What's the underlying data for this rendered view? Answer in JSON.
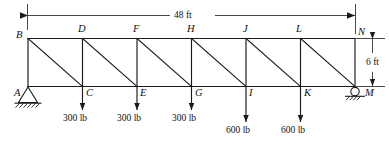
{
  "figure": {
    "type": "truss-diagram",
    "title": "",
    "units": "ft / lb",
    "ink_color": "#1a1a1a",
    "background": "#ffffff"
  },
  "dimensions": {
    "span": {
      "label": "48 ft",
      "value": 48,
      "unit": "ft",
      "orientation": "horizontal",
      "position": "top"
    },
    "depth": {
      "label": "6 ft",
      "value": 6,
      "unit": "ft",
      "orientation": "vertical",
      "position": "right"
    }
  },
  "geometry": {
    "panels": 6,
    "panel_length_ft": 8,
    "height_ft": 6,
    "top_chord_nodes": [
      "B",
      "D",
      "F",
      "H",
      "J",
      "L",
      "N"
    ],
    "bottom_chord_nodes": [
      "A",
      "C",
      "E",
      "G",
      "I",
      "K",
      "M"
    ]
  },
  "nodes": [
    {
      "id": "B",
      "chord": "top",
      "label": "B",
      "x_ft": 0,
      "y_ft": 6
    },
    {
      "id": "D",
      "chord": "top",
      "label": "D",
      "x_ft": 8,
      "y_ft": 6
    },
    {
      "id": "F",
      "chord": "top",
      "label": "F",
      "x_ft": 16,
      "y_ft": 6
    },
    {
      "id": "H",
      "chord": "top",
      "label": "H",
      "x_ft": 24,
      "y_ft": 6
    },
    {
      "id": "J",
      "chord": "top",
      "label": "J",
      "x_ft": 32,
      "y_ft": 6
    },
    {
      "id": "L",
      "chord": "top",
      "label": "L",
      "x_ft": 40,
      "y_ft": 6
    },
    {
      "id": "N",
      "chord": "top",
      "label": "N",
      "x_ft": 48,
      "y_ft": 6
    },
    {
      "id": "A",
      "chord": "bottom",
      "label": "A",
      "x_ft": 0,
      "y_ft": 0
    },
    {
      "id": "C",
      "chord": "bottom",
      "label": "C",
      "x_ft": 8,
      "y_ft": 0
    },
    {
      "id": "E",
      "chord": "bottom",
      "label": "E",
      "x_ft": 16,
      "y_ft": 0
    },
    {
      "id": "G",
      "chord": "bottom",
      "label": "G",
      "x_ft": 24,
      "y_ft": 0
    },
    {
      "id": "I",
      "chord": "bottom",
      "label": "I",
      "x_ft": 32,
      "y_ft": 0
    },
    {
      "id": "K",
      "chord": "bottom",
      "label": "K",
      "x_ft": 40,
      "y_ft": 0
    },
    {
      "id": "M",
      "chord": "bottom",
      "label": "M",
      "x_ft": 48,
      "y_ft": 0
    }
  ],
  "members": {
    "top_chord": [
      [
        "B",
        "D"
      ],
      [
        "D",
        "F"
      ],
      [
        "F",
        "H"
      ],
      [
        "H",
        "J"
      ],
      [
        "J",
        "L"
      ],
      [
        "L",
        "N"
      ]
    ],
    "bottom_chord": [
      [
        "A",
        "C"
      ],
      [
        "C",
        "E"
      ],
      [
        "E",
        "G"
      ],
      [
        "G",
        "I"
      ],
      [
        "I",
        "K"
      ],
      [
        "K",
        "M"
      ]
    ],
    "verticals": [
      [
        "B",
        "A"
      ],
      [
        "D",
        "C"
      ],
      [
        "F",
        "E"
      ],
      [
        "H",
        "G"
      ],
      [
        "J",
        "I"
      ],
      [
        "L",
        "K"
      ],
      [
        "N",
        "M"
      ]
    ],
    "diagonals": [
      [
        "B",
        "C"
      ],
      [
        "D",
        "E"
      ],
      [
        "F",
        "G"
      ],
      [
        "H",
        "I"
      ],
      [
        "J",
        "K"
      ],
      [
        "L",
        "M"
      ]
    ]
  },
  "loads": [
    {
      "node": "C",
      "label": "300 lb",
      "magnitude": 300,
      "unit": "lb",
      "direction": "down"
    },
    {
      "node": "E",
      "label": "300 lb",
      "magnitude": 300,
      "unit": "lb",
      "direction": "down"
    },
    {
      "node": "G",
      "label": "300 lb",
      "magnitude": 300,
      "unit": "lb",
      "direction": "down"
    },
    {
      "node": "I",
      "label": "600 lb",
      "magnitude": 600,
      "unit": "lb",
      "direction": "down"
    },
    {
      "node": "K",
      "label": "600 lb",
      "magnitude": 600,
      "unit": "lb",
      "direction": "down"
    }
  ],
  "supports": [
    {
      "node": "A",
      "type": "pin",
      "symbol": "triangle-with-hatched-ground"
    },
    {
      "node": "M",
      "type": "roller",
      "symbol": "circle-with-hatched-ground"
    }
  ]
}
